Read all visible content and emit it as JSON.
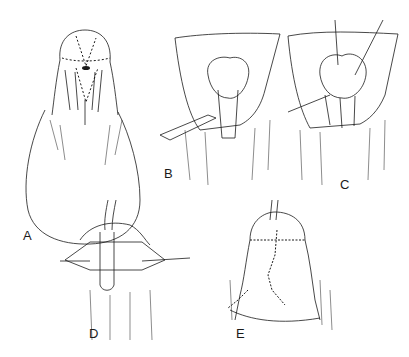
{
  "figure": {
    "type": "surgical illustration",
    "style": "pen-and-ink line drawing",
    "colors": {
      "ink": "#1a1a1a",
      "background": "#ffffff"
    },
    "panels": [
      {
        "id": "A",
        "label": "A",
        "description": "penis with dashed incision lines marked on glans and shaft"
      },
      {
        "id": "B",
        "label": "B",
        "description": "retracted skin flaps exposing glans, forceps holding tissue"
      },
      {
        "id": "C",
        "label": "C",
        "description": "further dissection with traction sutures and instrument"
      },
      {
        "id": "D",
        "label": "D",
        "description": "tubularized urethra with catheter, lateral stay sutures"
      },
      {
        "id": "E",
        "label": "E",
        "description": "completed repair with sutured closure lines"
      }
    ]
  }
}
